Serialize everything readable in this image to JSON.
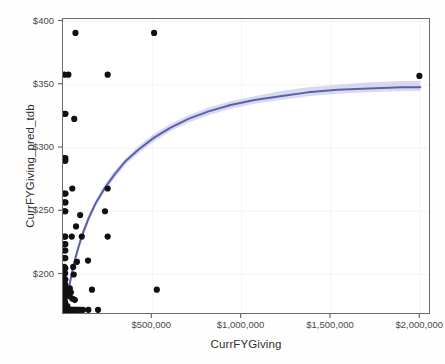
{
  "chart_data": {
    "type": "scatter",
    "title": "",
    "xlabel": "CurrFYGiving",
    "ylabel": "CurrFYGiving_pred_tdb",
    "xlim": [
      0,
      2060000
    ],
    "ylim": [
      168,
      402
    ],
    "grid": true,
    "legend": null,
    "xticks": [
      500000,
      1000000,
      1500000,
      2000000
    ],
    "xtick_labels": [
      "$500,000",
      "$1,000,000",
      "$1,500,000",
      "$2,000,000"
    ],
    "yticks": [
      200,
      250,
      300,
      350,
      400
    ],
    "ytick_labels": [
      "$200",
      "$250",
      "$300",
      "$350",
      "$400"
    ],
    "marker_color": "#111111",
    "marker_size": 3.1,
    "fit": {
      "type": "loess-logarithmic",
      "line_color": "#5a5fb0",
      "band_color": "#b9bce0",
      "line_width": 2.0,
      "description": "smoothed logarithmic trend with confidence band",
      "points": [
        [
          14000,
          172
        ],
        [
          22000,
          179
        ],
        [
          32000,
          188
        ],
        [
          45000,
          198
        ],
        [
          62000,
          209
        ],
        [
          85000,
          221
        ],
        [
          112000,
          233
        ],
        [
          145000,
          245
        ],
        [
          185000,
          257
        ],
        [
          232000,
          268
        ],
        [
          288000,
          279
        ],
        [
          352000,
          290
        ],
        [
          425000,
          299
        ],
        [
          508000,
          308
        ],
        [
          600000,
          316
        ],
        [
          702000,
          323
        ],
        [
          815000,
          329
        ],
        [
          938000,
          334
        ],
        [
          1072000,
          338
        ],
        [
          1216000,
          341
        ],
        [
          1370000,
          344
        ],
        [
          1535000,
          346
        ],
        [
          1710000,
          347
        ],
        [
          1895000,
          348
        ],
        [
          2000000,
          348
        ]
      ],
      "band_upper": [
        [
          14000,
          176
        ],
        [
          22000,
          183
        ],
        [
          32000,
          191
        ],
        [
          45000,
          201
        ],
        [
          62000,
          212
        ],
        [
          85000,
          224
        ],
        [
          112000,
          236
        ],
        [
          145000,
          248
        ],
        [
          185000,
          259
        ],
        [
          232000,
          271
        ],
        [
          288000,
          282
        ],
        [
          352000,
          292
        ],
        [
          425000,
          302
        ],
        [
          508000,
          311
        ],
        [
          600000,
          319
        ],
        [
          702000,
          326
        ],
        [
          815000,
          332
        ],
        [
          938000,
          337
        ],
        [
          1072000,
          341
        ],
        [
          1216000,
          345
        ],
        [
          1370000,
          348
        ],
        [
          1535000,
          350
        ],
        [
          1710000,
          352
        ],
        [
          1895000,
          353
        ],
        [
          2000000,
          353
        ]
      ],
      "band_lower": [
        [
          14000,
          168
        ],
        [
          22000,
          175
        ],
        [
          32000,
          185
        ],
        [
          45000,
          195
        ],
        [
          62000,
          206
        ],
        [
          85000,
          218
        ],
        [
          112000,
          230
        ],
        [
          145000,
          242
        ],
        [
          185000,
          254
        ],
        [
          232000,
          265
        ],
        [
          288000,
          276
        ],
        [
          352000,
          287
        ],
        [
          425000,
          296
        ],
        [
          508000,
          305
        ],
        [
          600000,
          313
        ],
        [
          702000,
          320
        ],
        [
          815000,
          326
        ],
        [
          938000,
          331
        ],
        [
          1072000,
          335
        ],
        [
          1216000,
          338
        ],
        [
          1370000,
          341
        ],
        [
          1535000,
          343
        ],
        [
          1710000,
          344
        ],
        [
          1895000,
          345
        ],
        [
          2000000,
          345
        ]
      ]
    },
    "points": [
      [
        70000,
        391
      ],
      [
        510000,
        391
      ],
      [
        30000,
        358
      ],
      [
        250000,
        358
      ],
      [
        1995000,
        357
      ],
      [
        14000,
        327
      ],
      [
        63000,
        323
      ],
      [
        13000,
        292
      ],
      [
        13000,
        290
      ],
      [
        14000,
        264
      ],
      [
        52000,
        268
      ],
      [
        250000,
        268
      ],
      [
        14000,
        257
      ],
      [
        13000,
        250
      ],
      [
        235000,
        250
      ],
      [
        96000,
        247
      ],
      [
        73000,
        238
      ],
      [
        13000,
        230
      ],
      [
        49000,
        230
      ],
      [
        105000,
        230
      ],
      [
        250000,
        230
      ],
      [
        13000,
        224
      ],
      [
        13000,
        219
      ],
      [
        13000,
        213
      ],
      [
        140000,
        211
      ],
      [
        78000,
        210
      ],
      [
        13000,
        205
      ],
      [
        57000,
        206
      ],
      [
        12000,
        201
      ],
      [
        60000,
        200
      ],
      [
        13000,
        196
      ],
      [
        13000,
        192
      ],
      [
        12000,
        189
      ],
      [
        38000,
        189
      ],
      [
        162000,
        188
      ],
      [
        525000,
        188
      ],
      [
        13000,
        186
      ],
      [
        32000,
        186
      ],
      [
        44000,
        186
      ],
      [
        12000,
        183
      ],
      [
        36000,
        183
      ],
      [
        52000,
        181
      ],
      [
        66000,
        180
      ],
      [
        12000,
        178
      ],
      [
        12000,
        176
      ],
      [
        24000,
        175
      ],
      [
        8000,
        172
      ],
      [
        13000,
        172
      ],
      [
        18000,
        172
      ],
      [
        23000,
        172
      ],
      [
        28000,
        172
      ],
      [
        33000,
        172
      ],
      [
        38000,
        172
      ],
      [
        43000,
        172
      ],
      [
        48000,
        172
      ],
      [
        54000,
        172
      ],
      [
        60000,
        172
      ],
      [
        66000,
        172
      ],
      [
        73000,
        172
      ],
      [
        80000,
        172
      ],
      [
        88000,
        172
      ],
      [
        97000,
        172
      ],
      [
        112000,
        172
      ],
      [
        142000,
        172
      ],
      [
        196000,
        172
      ],
      [
        7000,
        174
      ],
      [
        7000,
        178
      ],
      [
        7000,
        182
      ],
      [
        7000,
        186
      ],
      [
        7000,
        190
      ],
      [
        7000,
        194
      ],
      [
        7000,
        200
      ],
      [
        7000,
        206
      ],
      [
        7000,
        213
      ],
      [
        7000,
        219
      ],
      [
        7000,
        224
      ],
      [
        7000,
        230
      ],
      [
        7000,
        250
      ],
      [
        7000,
        257
      ],
      [
        7000,
        264
      ],
      [
        7000,
        290
      ],
      [
        7000,
        292
      ],
      [
        7000,
        327
      ],
      [
        7000,
        358
      ]
    ]
  },
  "axes": {
    "y_title": "CurrFYGiving_pred_tdb",
    "x_title": "CurrFYGiving"
  },
  "colors": {
    "line": "#5a5fb0",
    "band": "#c3c6e6",
    "marker": "#111111",
    "frame": "#6b6b6b",
    "grid": "#f4f4f6",
    "background": "#ffffff"
  }
}
